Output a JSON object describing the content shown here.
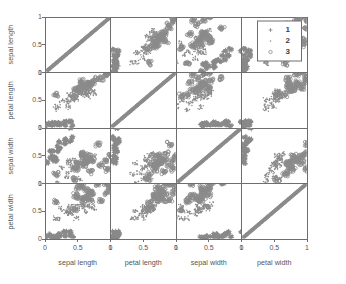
{
  "chart_data": {
    "type": "scatter",
    "plot_kind": "scatter-plot-matrix",
    "title": "",
    "variables": [
      "sepal length",
      "petal length",
      "sepal width",
      "petal width"
    ],
    "row_labels": [
      "sepal length",
      "petal length",
      "sepal width",
      "petal width"
    ],
    "col_labels": [
      "sepal length",
      "petal length",
      "sepal width",
      "petal width"
    ],
    "xlabel": "",
    "ylabel": "",
    "xlim": [
      0,
      1
    ],
    "ylim": [
      0,
      1
    ],
    "xticks": [
      "0",
      "0.5",
      "1"
    ],
    "yticks": [
      "0",
      "0.5",
      "1"
    ],
    "xtick_values": [
      0,
      0.5,
      1
    ],
    "ytick_values": [
      0,
      0.5,
      1
    ],
    "grid": false,
    "legend_position": "top-right",
    "legend": [
      {
        "label": "1",
        "marker": "plus"
      },
      {
        "label": "2",
        "marker": "dot"
      },
      {
        "label": "3",
        "marker": "circle"
      }
    ],
    "marker_color": "#8a8a8a",
    "axis_color": "#6e6e6e",
    "background": "#ffffff",
    "series": [
      {
        "name": "1",
        "marker": "plus",
        "points": [
          {
            "sepal length": 0.222,
            "petal length": 0.068,
            "sepal width": 0.625,
            "petal width": 0.042
          },
          {
            "sepal length": 0.167,
            "petal length": 0.068,
            "sepal width": 0.417,
            "petal width": 0.042
          },
          {
            "sepal length": 0.111,
            "petal length": 0.051,
            "sepal width": 0.5,
            "petal width": 0.042
          },
          {
            "sepal length": 0.083,
            "petal length": 0.085,
            "sepal width": 0.458,
            "petal width": 0.042
          },
          {
            "sepal length": 0.194,
            "petal length": 0.068,
            "sepal width": 0.667,
            "petal width": 0.042
          },
          {
            "sepal length": 0.306,
            "petal length": 0.119,
            "sepal width": 0.792,
            "petal width": 0.125
          },
          {
            "sepal length": 0.083,
            "petal length": 0.068,
            "sepal width": 0.583,
            "petal width": 0.083
          },
          {
            "sepal length": 0.194,
            "petal length": 0.085,
            "sepal width": 0.583,
            "petal width": 0.042
          },
          {
            "sepal length": 0.028,
            "petal length": 0.068,
            "sepal width": 0.375,
            "petal width": 0.042
          },
          {
            "sepal length": 0.167,
            "petal length": 0.085,
            "sepal width": 0.458,
            "petal width": 0.0
          },
          {
            "sepal length": 0.306,
            "petal length": 0.085,
            "sepal width": 0.708,
            "petal width": 0.042
          },
          {
            "sepal length": 0.139,
            "petal length": 0.102,
            "sepal width": 0.583,
            "petal width": 0.042
          },
          {
            "sepal length": 0.139,
            "petal length": 0.068,
            "sepal width": 0.417,
            "petal width": 0.0
          },
          {
            "sepal length": 0.0,
            "petal length": 0.017,
            "sepal width": 0.417,
            "petal width": 0.0
          },
          {
            "sepal length": 0.417,
            "petal length": 0.034,
            "sepal width": 0.833,
            "petal width": 0.042
          },
          {
            "sepal length": 0.389,
            "petal length": 0.102,
            "sepal width": 1.0,
            "petal width": 0.125
          },
          {
            "sepal length": 0.306,
            "petal length": 0.051,
            "sepal width": 0.792,
            "petal width": 0.125
          },
          {
            "sepal length": 0.222,
            "petal length": 0.068,
            "sepal width": 0.625,
            "petal width": 0.083
          },
          {
            "sepal length": 0.389,
            "petal length": 0.119,
            "sepal width": 0.75,
            "petal width": 0.083
          },
          {
            "sepal length": 0.222,
            "petal length": 0.085,
            "sepal width": 0.75,
            "petal width": 0.083
          }
        ]
      },
      {
        "name": "2",
        "marker": "dot",
        "points": [
          {
            "sepal length": 0.75,
            "petal length": 0.627,
            "sepal width": 0.5,
            "petal width": 0.542
          },
          {
            "sepal length": 0.583,
            "petal length": 0.593,
            "sepal width": 0.5,
            "petal width": 0.583
          },
          {
            "sepal length": 0.722,
            "petal length": 0.661,
            "sepal width": 0.458,
            "petal width": 0.583
          },
          {
            "sepal length": 0.333,
            "petal length": 0.508,
            "sepal width": 0.125,
            "petal width": 0.5
          },
          {
            "sepal length": 0.611,
            "petal length": 0.61,
            "sepal width": 0.333,
            "petal width": 0.583
          },
          {
            "sepal length": 0.389,
            "petal length": 0.576,
            "sepal width": 0.333,
            "petal width": 0.5
          },
          {
            "sepal length": 0.556,
            "petal length": 0.644,
            "sepal width": 0.542,
            "petal width": 0.625
          },
          {
            "sepal length": 0.167,
            "petal length": 0.339,
            "sepal width": 0.167,
            "petal width": 0.375
          },
          {
            "sepal length": 0.639,
            "petal length": 0.61,
            "sepal width": 0.375,
            "petal width": 0.5
          },
          {
            "sepal length": 0.25,
            "petal length": 0.492,
            "sepal width": 0.292,
            "petal width": 0.542
          },
          {
            "sepal length": 0.194,
            "petal length": 0.39,
            "sepal width": 0.0,
            "petal width": 0.375
          },
          {
            "sepal length": 0.444,
            "petal length": 0.525,
            "sepal width": 0.417,
            "petal width": 0.583
          },
          {
            "sepal length": 0.472,
            "petal length": 0.508,
            "sepal width": 0.083,
            "petal width": 0.375
          },
          {
            "sepal length": 0.5,
            "petal length": 0.661,
            "sepal width": 0.375,
            "petal width": 0.542
          },
          {
            "sepal length": 0.361,
            "petal length": 0.373,
            "sepal width": 0.375,
            "petal width": 0.5
          },
          {
            "sepal length": 0.667,
            "petal length": 0.559,
            "sepal width": 0.458,
            "petal width": 0.583
          },
          {
            "sepal length": 0.361,
            "petal length": 0.593,
            "sepal width": 0.417,
            "petal width": 0.583
          },
          {
            "sepal length": 0.417,
            "petal length": 0.525,
            "sepal width": 0.292,
            "petal width": 0.458
          },
          {
            "sepal length": 0.528,
            "petal length": 0.61,
            "sepal width": 0.083,
            "petal width": 0.583
          },
          {
            "sepal length": 0.361,
            "petal length": 0.441,
            "sepal width": 0.208,
            "petal width": 0.458
          }
        ]
      },
      {
        "name": "3",
        "marker": "circle",
        "points": [
          {
            "sepal length": 0.556,
            "petal length": 0.847,
            "sepal width": 0.542,
            "petal width": 1.0
          },
          {
            "sepal length": 0.5,
            "petal length": 0.678,
            "sepal width": 0.292,
            "petal width": 0.75
          },
          {
            "sepal length": 0.722,
            "petal length": 0.831,
            "sepal width": 0.417,
            "petal width": 0.833
          },
          {
            "sepal length": 0.583,
            "petal length": 0.746,
            "sepal width": 0.375,
            "petal width": 0.708
          },
          {
            "sepal length": 0.639,
            "petal length": 0.797,
            "sepal width": 0.417,
            "petal width": 0.875
          },
          {
            "sepal length": 0.944,
            "petal length": 0.966,
            "sepal width": 0.417,
            "petal width": 0.833
          },
          {
            "sepal length": 0.167,
            "petal length": 0.593,
            "sepal width": 0.167,
            "petal width": 0.667
          },
          {
            "sepal length": 0.861,
            "petal length": 0.898,
            "sepal width": 0.333,
            "petal width": 0.708
          },
          {
            "sepal length": 0.694,
            "petal length": 0.814,
            "sepal width": 0.208,
            "petal width": 0.708
          },
          {
            "sepal length": 0.806,
            "petal length": 0.898,
            "sepal width": 0.708,
            "petal width": 1.0
          },
          {
            "sepal length": 0.667,
            "petal length": 0.695,
            "sepal width": 0.5,
            "petal width": 0.792
          },
          {
            "sepal length": 0.583,
            "petal length": 0.712,
            "sepal width": 0.333,
            "petal width": 0.75
          },
          {
            "sepal length": 0.694,
            "petal length": 0.763,
            "sepal width": 0.417,
            "petal width": 0.833
          },
          {
            "sepal length": 0.472,
            "petal length": 0.678,
            "sepal width": 0.25,
            "petal width": 0.792
          },
          {
            "sepal length": 0.5,
            "petal length": 0.712,
            "sepal width": 0.375,
            "petal width": 0.917
          },
          {
            "sepal length": 0.583,
            "petal length": 0.763,
            "sepal width": 0.5,
            "petal width": 0.917
          },
          {
            "sepal length": 0.639,
            "petal length": 0.78,
            "sepal width": 0.417,
            "petal width": 0.75
          },
          {
            "sepal length": 1.0,
            "petal length": 1.0,
            "sepal width": 0.5,
            "petal width": 0.917
          },
          {
            "sepal length": 0.944,
            "petal length": 0.966,
            "sepal width": 0.25,
            "petal width": 1.0
          },
          {
            "sepal length": 0.444,
            "petal length": 0.576,
            "sepal width": 0.083,
            "petal width": 0.542
          }
        ]
      }
    ]
  },
  "axes": {
    "y_labels": [
      "sepal length",
      "petal length",
      "sepal width",
      "petal width"
    ],
    "x_labels": [
      "sepal length",
      "petal length",
      "sepal width",
      "petal width"
    ],
    "tick_labels": [
      "0",
      "0.5",
      "1"
    ],
    "last_tick_label": "1"
  },
  "legend": {
    "entries": [
      {
        "label": "1"
      },
      {
        "label": "2"
      },
      {
        "label": "3"
      }
    ]
  }
}
